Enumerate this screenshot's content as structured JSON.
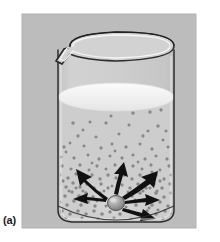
{
  "figure": {
    "panel_label": "(a)",
    "caption_text": "",
    "background_color": "#ffffff",
    "panel_color": "#bcbcbc",
    "panel_edge_color": "#a8a8a8"
  },
  "beaker": {
    "glass_outline_color": "#2b2b2b",
    "glass_highlight_color": "#f2f2f2",
    "body_fill_color": "#c4c4c4",
    "rim_label": "beaker-rim",
    "spout_label": "pouring-spout",
    "wall_label": "beaker-wall",
    "base_label": "beaker-base"
  },
  "liquid": {
    "surface_color": "#f0f0f0",
    "surface_edge_color": "#e2e2e2",
    "body_color": "#cccccc",
    "label": "liquid-solvent"
  },
  "solid": {
    "label": "dissolving-solid-particle",
    "fill_color": "#9a9a9a",
    "edge_color": "#4a4a4a",
    "highlight_color": "#d8d8d8",
    "center_x": 116,
    "center_y": 203,
    "radius_x": 8,
    "radius_y": 7
  },
  "arrows": {
    "label": "dissolution-direction-arrows",
    "color": "#111111",
    "count": 6,
    "items": [
      {
        "name": "arrow-upper-left",
        "angle_deg": 152,
        "length": 44
      },
      {
        "name": "arrow-left",
        "angle_deg": 184,
        "length": 40
      },
      {
        "name": "arrow-upper-right",
        "angle_deg": 36,
        "length": 46
      },
      {
        "name": "arrow-right",
        "angle_deg": 8,
        "length": 44
      },
      {
        "name": "arrow-lower-right",
        "angle_deg": 340,
        "length": 44
      },
      {
        "name": "arrow-up",
        "angle_deg": 74,
        "length": 38
      }
    ]
  },
  "particles": {
    "label": "dissolved-solute-particles",
    "color": "#8d8d8d",
    "edge_color": "#6e6e6e",
    "count": 196,
    "description": "small dots densest near the dissolving solid and sparser toward the liquid surface"
  },
  "geometry": {
    "panel_x": 22,
    "panel_y": 14,
    "panel_w": 174,
    "panel_h": 214,
    "beaker_left": 56,
    "beaker_right": 176,
    "beaker_top": 40,
    "beaker_bottom": 222,
    "liquid_surface_y": 97,
    "liquid_surface_ry": 14
  }
}
